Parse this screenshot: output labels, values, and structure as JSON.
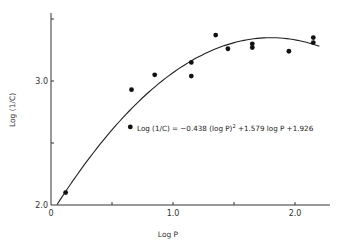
{
  "chart_data": {
    "type": "scatter",
    "title": "",
    "xlabel": "Log P",
    "ylabel": "Log (1/C)",
    "xlim": [
      0,
      2.2
    ],
    "ylim": [
      2.0,
      3.55
    ],
    "x_ticks": [
      0,
      0.5,
      1.0,
      1.5,
      2.0
    ],
    "x_tick_labels": [
      "0",
      "",
      "1.0",
      "",
      "2.0"
    ],
    "y_ticks": [
      2.0,
      2.5,
      3.0,
      3.5
    ],
    "y_tick_labels": [
      "2.0",
      "",
      "3.0",
      ""
    ],
    "grid": false,
    "legend": null,
    "series": [
      {
        "name": "observed",
        "type": "scatter",
        "points": [
          {
            "x": 0.12,
            "y": 2.1
          },
          {
            "x": 0.65,
            "y": 2.63
          },
          {
            "x": 0.66,
            "y": 2.93
          },
          {
            "x": 0.85,
            "y": 3.05
          },
          {
            "x": 1.15,
            "y": 3.15
          },
          {
            "x": 1.15,
            "y": 3.04
          },
          {
            "x": 1.35,
            "y": 3.37
          },
          {
            "x": 1.45,
            "y": 3.26
          },
          {
            "x": 1.65,
            "y": 3.3
          },
          {
            "x": 1.65,
            "y": 3.27
          },
          {
            "x": 1.95,
            "y": 3.24
          },
          {
            "x": 2.15,
            "y": 3.35
          },
          {
            "x": 2.15,
            "y": 3.31
          }
        ]
      },
      {
        "name": "fit",
        "type": "line",
        "equation": "Log (1/C) = -0.438 (log P)^2 + 1.579 log P + 1.926",
        "coefficients": {
          "a": -0.438,
          "b": 1.579,
          "c": 1.926
        },
        "x_range": [
          0.05,
          2.2
        ]
      }
    ],
    "annotations": [
      {
        "text": "Log (1/C) = −0.438 (log P)² + 1.579 log P + 1.926",
        "x": 1.05,
        "y": 2.63
      }
    ]
  },
  "labels": {
    "xlabel": "Log P",
    "ylabel": "Log (1/C)",
    "equation_prefix": "Log (1/C) = −0.438 (log P)",
    "equation_sup": "2",
    "equation_suffix": " +1.579 log P +1.926"
  }
}
